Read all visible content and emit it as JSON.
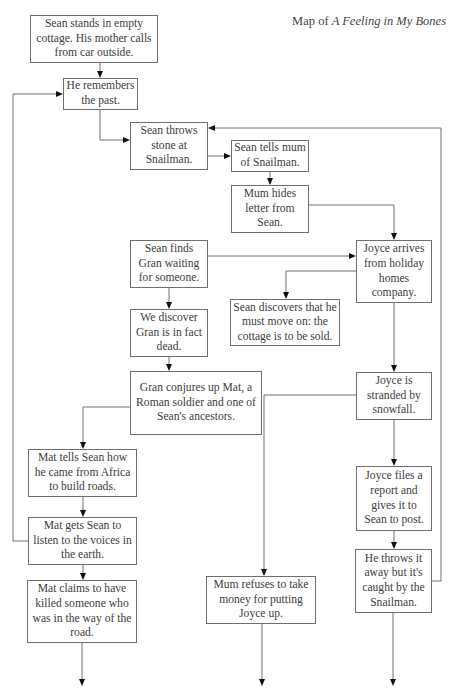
{
  "title": {
    "prefix": "Map of ",
    "book": "A Feeling in My Bones"
  },
  "nodes": [
    {
      "id": "n1",
      "text": "Sean stands in empty cottage. His mother calls from car outside."
    },
    {
      "id": "n2",
      "text": "He remembers the past."
    },
    {
      "id": "n3",
      "text": "Sean throws stone at Snailman."
    },
    {
      "id": "n4",
      "text": "Sean tells mum of Snailman."
    },
    {
      "id": "n5",
      "text": "Mum hides letter from Sean."
    },
    {
      "id": "n6",
      "text": "Sean finds Gran waiting for someone."
    },
    {
      "id": "n7",
      "text": "Joyce arrives from holiday homes company."
    },
    {
      "id": "n8",
      "text": "Sean discovers that he must move on: the cottage is to be sold."
    },
    {
      "id": "n9",
      "text": "We discover Gran is in fact dead."
    },
    {
      "id": "n10",
      "text": "Gran conjures up Mat, a Roman soldier and one of Sean's ancestors."
    },
    {
      "id": "n11",
      "text": "Joyce is stranded by snowfall."
    },
    {
      "id": "n12",
      "text": "Mat tells Sean how he came from Africa to build roads."
    },
    {
      "id": "n13",
      "text": "Joyce files a report and gives it to Sean to post."
    },
    {
      "id": "n14",
      "text": "Mat gets Sean to listen to the voices in the earth."
    },
    {
      "id": "n15",
      "text": "He throws it away but it's caught by the Snailman."
    },
    {
      "id": "n16",
      "text": "Mat claims to have killed someone who was in the way of the road."
    },
    {
      "id": "n17",
      "text": "Mum refuses to take money for putting Joyce up."
    }
  ],
  "edges": [
    [
      "n1",
      "n2"
    ],
    [
      "n2",
      "n3"
    ],
    [
      "n3",
      "n4"
    ],
    [
      "n4",
      "n5"
    ],
    [
      "n5",
      "n7"
    ],
    [
      "n6",
      "n7"
    ],
    [
      "n6",
      "n9"
    ],
    [
      "n7",
      "n8"
    ],
    [
      "n7",
      "n11"
    ],
    [
      "n9",
      "n10"
    ],
    [
      "n10",
      "n12"
    ],
    [
      "n11",
      "n13"
    ],
    [
      "n11",
      "n17"
    ],
    [
      "n12",
      "n14"
    ],
    [
      "n13",
      "n15"
    ],
    [
      "n14",
      "n2"
    ],
    [
      "n14",
      "n16"
    ],
    [
      "n15",
      "n3"
    ],
    [
      "n16",
      "continues"
    ],
    [
      "n17",
      "continues"
    ],
    [
      "n15",
      "continues"
    ]
  ],
  "colors": {
    "line": "#707070",
    "border": "#6e6e6e",
    "arrowhead": "#111111",
    "text": "#3c3c3c"
  }
}
